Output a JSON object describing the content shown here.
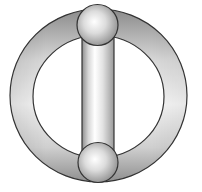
{
  "diagram": {
    "colors": {
      "background": "#ffffff",
      "outline": "#333333",
      "ring_dark": "#8a8a8a",
      "ring_light": "#f2f2f2",
      "cylinder_dark": "#9a9a9a",
      "cylinder_light": "#ffffff",
      "sphere_light": "#ffffff",
      "sphere_dark": "#8c8c8c"
    },
    "ring": {
      "cx": 98.5,
      "cy": 95.5,
      "outer_rx": 88.5,
      "outer_ry": 86.5,
      "inner_rx": 65.5,
      "inner_ry": 61
    },
    "cylinder": {
      "x": 82,
      "y": 28,
      "width": 32,
      "height": 136
    },
    "spheres": [
      {
        "name": "top",
        "cx": 97.5,
        "cy": 25,
        "r": 20.5
      },
      {
        "name": "bottom",
        "cx": 98,
        "cy": 162.5,
        "r": 20
      }
    ]
  }
}
